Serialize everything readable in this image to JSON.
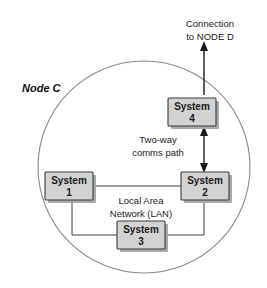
{
  "diagram": {
    "title": "Node C",
    "boundary_name": "node-c-boundary",
    "external_connection_label_line1": "Connection",
    "external_connection_label_line2": "to NODE D",
    "comms_label_line1": "Two-way",
    "comms_label_line2": "comms path",
    "lan_label_line1": "Local Area",
    "lan_label_line2": "Network (LAN)",
    "systems": [
      {
        "id": "system-1",
        "name_line1": "System",
        "name_line2": "1"
      },
      {
        "id": "system-2",
        "name_line1": "System",
        "name_line2": "2"
      },
      {
        "id": "system-3",
        "name_line1": "System",
        "name_line2": "3"
      },
      {
        "id": "system-4",
        "name_line1": "System",
        "name_line2": "4"
      }
    ],
    "colors": {
      "box_fill": "#d2d2d2",
      "box_border": "#3a3a3a",
      "circle_stroke": "#8a8a8a",
      "text": "#1a1a1a",
      "background": "#ffffff"
    }
  }
}
